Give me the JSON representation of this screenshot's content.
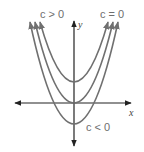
{
  "diagram": {
    "axes": {
      "x_label": "x",
      "y_label": "y"
    },
    "curves": [
      {
        "name": "c-positive",
        "vertex_y_px": 82
      },
      {
        "name": "c-zero",
        "vertex_y_px": 103
      },
      {
        "name": "c-negative",
        "vertex_y_px": 124
      }
    ],
    "labels": {
      "c_positive": "c > 0",
      "c_zero": "c = 0",
      "c_negative": "c < 0"
    },
    "colors": {
      "curve": "#707070",
      "axis": "#222222",
      "label": "#6e6e6e"
    }
  }
}
